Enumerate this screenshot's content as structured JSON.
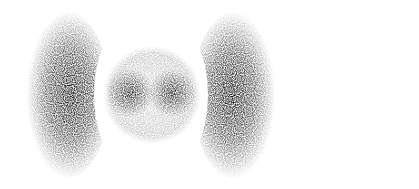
{
  "figure": {
    "background": "#ffffff",
    "ink": "#000000",
    "components": [
      {
        "name": "left-crescent-lobe",
        "cx": 62,
        "cy": 95,
        "rx": 36,
        "ry": 80
      },
      {
        "name": "inner-shell",
        "cx": 152,
        "cy": 95,
        "r": 48
      },
      {
        "name": "inner-left-lobe",
        "cx": 130,
        "cy": 93,
        "r": 22
      },
      {
        "name": "inner-right-lobe",
        "cx": 172,
        "cy": 93,
        "r": 22
      },
      {
        "name": "right-crescent-lobe",
        "cx": 238,
        "cy": 95,
        "rx": 36,
        "ry": 80
      }
    ]
  }
}
